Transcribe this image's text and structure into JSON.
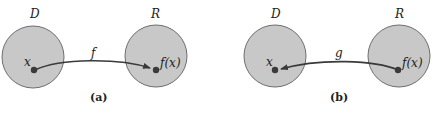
{
  "panels": [
    {
      "caption": "(a)",
      "left_set_label": "D",
      "right_set_label": "R",
      "left_point_label": "x",
      "right_point_label": "f(x)",
      "arrow_label": "f",
      "arrow_direction": "left-to-right"
    },
    {
      "caption": "(b)",
      "left_set_label": "D",
      "right_set_label": "R",
      "left_point_label": "x",
      "right_point_label": "f(x)",
      "arrow_label": "g",
      "arrow_direction": "right-to-left"
    }
  ],
  "colors": {
    "set_fill": "#c8c8c8",
    "set_stroke": "#6e6e6e",
    "point": "#3a3a3a",
    "arrow": "#3a3a3a"
  }
}
